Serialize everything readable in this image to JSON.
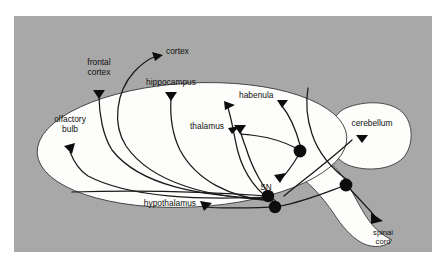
{
  "figure": {
    "panel_background_color": "#a8a8a8",
    "brain_fill_color": "#fdfdfb",
    "outline_color": "#3a3a3a",
    "axon_color": "#1a1a1a",
    "soma_color": "#0d0d0d"
  },
  "labels": {
    "cortex": "cortex",
    "frontal_cortex_line1": "frontal",
    "frontal_cortex_line2": "cortex",
    "hippocampus": "hippocampus",
    "habenula": "habenula",
    "olfactory_bulb_line1": "olfactory",
    "olfactory_bulb_line2": "bulb",
    "thalamus": "thalamus",
    "hypothalamus": "hypothalamus",
    "substantia_nigra": "SN",
    "cerebellum": "cerebellum",
    "spinal_cord_line1": "spinal",
    "spinal_cord_line2": "cord"
  },
  "structures": [
    {
      "name": "cerebrum",
      "shape": "large-ellipse"
    },
    {
      "name": "cerebellum",
      "shape": "rounded-lobe-right"
    },
    {
      "name": "brainstem-spinal-cord",
      "shape": "curved-band-lower-right"
    }
  ],
  "cell_bodies": [
    {
      "name": "soma-1",
      "cx": 300,
      "cy": 151,
      "r": 6.4
    },
    {
      "name": "soma-2",
      "cx": 268,
      "cy": 196,
      "r": 6.2
    },
    {
      "name": "soma-3",
      "cx": 275,
      "cy": 207,
      "r": 6.2
    },
    {
      "name": "soma-4",
      "cx": 346,
      "cy": 185,
      "r": 6.4
    }
  ],
  "projection_targets": [
    "cortex",
    "frontal cortex",
    "hippocampus",
    "habenula",
    "olfactory bulb",
    "thalamus",
    "hypothalamus",
    "SN",
    "cerebellum",
    "spinal cord"
  ]
}
